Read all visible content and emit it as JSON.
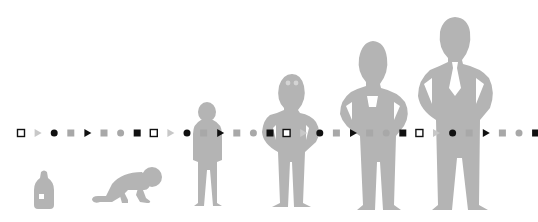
{
  "illustration": {
    "title": "Human growth stages timeline",
    "figure_color": "#b4b4b4",
    "marker_dark": "#111111",
    "marker_gray": "#a8a8a8",
    "marker_line_y": 133,
    "marker_spacing": 16.6,
    "marker_start_x": 21,
    "marker_pattern": [
      "hollow-square",
      "gray-triangle",
      "black-circle",
      "gray-square",
      "black-triangle",
      "gray-square",
      "gray-circle",
      "black-square"
    ],
    "stages": [
      {
        "id": "bottle",
        "label": "Baby bottle"
      },
      {
        "id": "crawling-baby",
        "label": "Crawling baby"
      },
      {
        "id": "child",
        "label": "Child"
      },
      {
        "id": "boy",
        "label": "Boy"
      },
      {
        "id": "teen",
        "label": "Teen"
      },
      {
        "id": "adult",
        "label": "Adult"
      }
    ]
  }
}
